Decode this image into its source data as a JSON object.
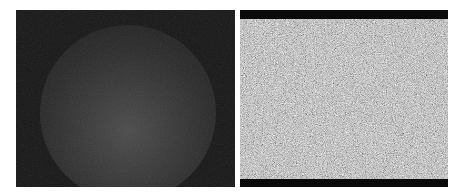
{
  "figure": {
    "panels": [
      {
        "id": "left",
        "description": "dark image with faint circular illuminated region",
        "background_color": "#161616",
        "highlight_color": "#4a4a4a"
      },
      {
        "id": "right",
        "description": "gray noise texture image with black bars top and bottom",
        "background_color": "#8c8c8c",
        "bar_color": "#0a0a0a"
      }
    ]
  }
}
